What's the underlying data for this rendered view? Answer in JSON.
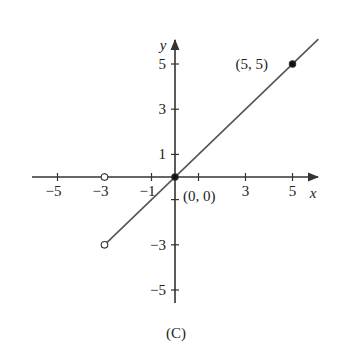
{
  "chart_data": {
    "type": "line",
    "title": "",
    "caption": "(C)",
    "xlabel": "x",
    "ylabel": "y",
    "xlim": [
      -6.2,
      6.2
    ],
    "ylim": [
      -5.5,
      6.0
    ],
    "grid": false,
    "x_ticks": [
      -5,
      -3,
      -1,
      1,
      3,
      5
    ],
    "x_tick_labels": [
      "−5",
      "−3",
      "−1",
      "",
      "3",
      "5"
    ],
    "y_ticks": [
      -5,
      -3,
      -1,
      1,
      3,
      5
    ],
    "y_tick_labels": [
      "−5",
      "−3",
      "",
      "1",
      "3",
      "5"
    ],
    "series": [
      {
        "name": "y = x for x > -3",
        "x": [
          -3,
          6.1
        ],
        "y": [
          -3,
          6.1
        ],
        "color": "#555555"
      },
      {
        "name": "y = 0 for x < -3",
        "x": [
          -6.2,
          -3
        ],
        "y": [
          0,
          0
        ],
        "color": "#333333",
        "note": "coincides with x-axis"
      }
    ],
    "points": [
      {
        "x": -3,
        "y": 0,
        "style": "open",
        "label": ""
      },
      {
        "x": -3,
        "y": -3,
        "style": "open",
        "label": ""
      },
      {
        "x": 0,
        "y": 0,
        "style": "filled",
        "label": "(0, 0)"
      },
      {
        "x": 5,
        "y": 5,
        "style": "filled",
        "label": "(5, 5)"
      }
    ],
    "annotations": [
      {
        "text": "(5, 5)",
        "at": [
          5,
          5
        ]
      },
      {
        "text": "(0, 0)",
        "at": [
          0,
          0
        ]
      }
    ]
  }
}
